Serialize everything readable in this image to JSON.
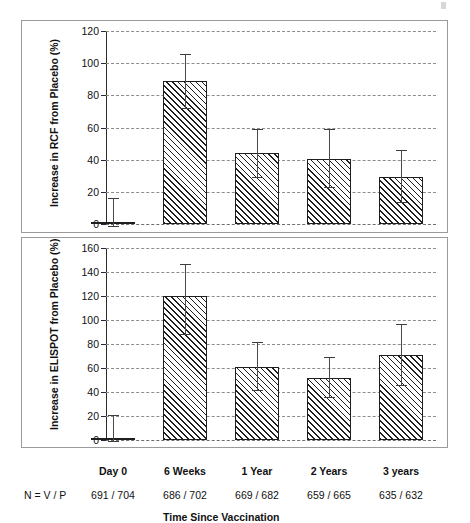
{
  "chart_data": [
    {
      "type": "bar",
      "panel": "top",
      "title": "",
      "xlabel": "Time Since Vaccination",
      "ylabel": "Increase in RCF from Placebo (%)",
      "categories": [
        "Day 0",
        "6 Weeks",
        "1 Year",
        "2 Years",
        "3 years"
      ],
      "values": [
        1.5,
        89,
        44,
        40.5,
        29.5
      ],
      "error_upper": [
        16,
        106,
        59,
        59,
        46
      ],
      "error_lower": [
        -1,
        72,
        29,
        23,
        13.5
      ],
      "ylim": [
        0,
        120
      ],
      "yticks": [
        0,
        20,
        40,
        60,
        80,
        100,
        120
      ],
      "grid": true,
      "legend": "none"
    },
    {
      "type": "bar",
      "panel": "bottom",
      "title": "",
      "xlabel": "Time Since Vaccination",
      "ylabel": "Increase in ELISPOT from Placebo (%)",
      "categories": [
        "Day 0",
        "6 Weeks",
        "1 Year",
        "2 Years",
        "3 years"
      ],
      "values": [
        1.5,
        120,
        60.5,
        52,
        71
      ],
      "error_upper": [
        20.5,
        147,
        81.5,
        69.5,
        97
      ],
      "error_lower": [
        -1,
        88,
        42,
        36,
        46
      ],
      "ylim": [
        0,
        160
      ],
      "yticks": [
        0,
        20,
        40,
        60,
        80,
        100,
        120,
        140,
        160
      ],
      "grid": true,
      "legend": "none"
    }
  ],
  "axes": {
    "top": {
      "ylabel": "Increase in RCF from Placebo (%)",
      "yticks": [
        "0",
        "20",
        "40",
        "60",
        "80",
        "100",
        "120"
      ]
    },
    "bottom": {
      "ylabel": "Increase in ELISPOT from Placebo (%)",
      "yticks": [
        "0",
        "20",
        "40",
        "60",
        "80",
        "100",
        "120",
        "140",
        "160"
      ]
    }
  },
  "xaxis": {
    "title": "Time Since Vaccination",
    "n_row_key": "N = V / P",
    "categories": [
      {
        "label": "Day 0",
        "n": "691 / 704"
      },
      {
        "label": "6 Weeks",
        "n": "686 / 702"
      },
      {
        "label": "1 Year",
        "n": "669 / 682"
      },
      {
        "label": "2 Years",
        "n": "659 / 665"
      },
      {
        "label": "3 years",
        "n": "635 / 632"
      }
    ]
  },
  "style": {
    "bar_edge_color": "#1e1e1e",
    "bar_hatch_color": "#1e1e1e",
    "bar_face_color": "#ffffff",
    "grid_color": "#8c8c8c",
    "panel_border_color": "#9a9a9a",
    "error_bar_color": "#4a4a4a"
  }
}
